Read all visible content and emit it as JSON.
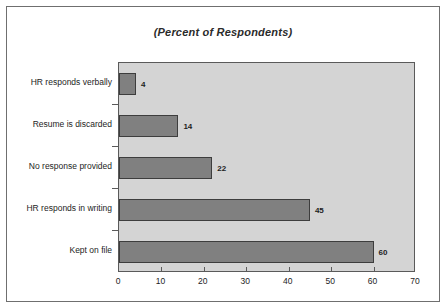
{
  "chart_data": {
    "type": "bar",
    "orientation": "horizontal",
    "title": "(Percent of Respondents)",
    "xlabel": "",
    "ylabel": "",
    "xlim": [
      0,
      70
    ],
    "xticks": [
      0,
      10,
      20,
      30,
      40,
      50,
      60,
      70
    ],
    "grid": false,
    "legend": false,
    "categories": [
      "HR responds verbally",
      "Resume is discarded",
      "No response provided",
      "HR responds in writing",
      "Kept on file"
    ],
    "values": [
      4,
      14,
      22,
      45,
      60
    ],
    "value_labels": [
      "4",
      "14",
      "22",
      "45",
      "60"
    ],
    "tick_labels": [
      "0",
      "10",
      "20",
      "30",
      "40",
      "50",
      "60",
      "70"
    ],
    "colors": {
      "bar_fill": "#808080",
      "bar_outline": "#3d3d3d",
      "plot_background": "#d4d4d4",
      "plot_border": "#5a5a5a",
      "page_background": "#ffffff",
      "frame_border": "#6f6f6f",
      "text": "#1d1d1d"
    }
  }
}
